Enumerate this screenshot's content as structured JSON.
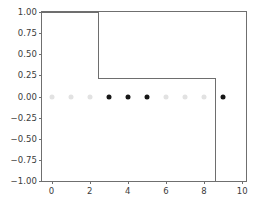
{
  "chart_data": {
    "type": "line",
    "title": "",
    "xlabel": "",
    "ylabel": "",
    "xlim": [
      -0.5,
      10.2
    ],
    "ylim": [
      -1.0,
      1.0
    ],
    "grid": false,
    "legend": null,
    "x_ticks": [
      0,
      2,
      4,
      6,
      8,
      10
    ],
    "x_tick_labels": [
      "0",
      "2",
      "4",
      "6",
      "8",
      "10"
    ],
    "y_ticks": [
      -1.0,
      -0.75,
      -0.5,
      -0.25,
      0.0,
      0.25,
      0.5,
      0.75,
      1.0
    ],
    "y_tick_labels": [
      "−1.00",
      "−0.75",
      "−0.50",
      "−0.25",
      "0.00",
      "0.25",
      "0.50",
      "0.75",
      "1.00"
    ],
    "series": [
      {
        "name": "step-curve",
        "type": "step",
        "color": "#6e6e6e",
        "linewidth": 1.3,
        "vertices": [
          {
            "x": -0.5,
            "y": 1.0
          },
          {
            "x": 2.45,
            "y": 1.0
          },
          {
            "x": 2.45,
            "y": 0.22
          },
          {
            "x": 8.6,
            "y": 0.22
          },
          {
            "x": 8.6,
            "y": -1.0
          }
        ]
      },
      {
        "name": "samples",
        "type": "scatter",
        "marker": "o",
        "size": 5,
        "y_value": 0.0,
        "points": [
          {
            "x": 0,
            "y": 0.0,
            "color": "#e2e2e2",
            "state": "inactive"
          },
          {
            "x": 1,
            "y": 0.0,
            "color": "#e2e2e2",
            "state": "inactive"
          },
          {
            "x": 2,
            "y": 0.0,
            "color": "#e2e2e2",
            "state": "inactive"
          },
          {
            "x": 3,
            "y": 0.0,
            "color": "#161616",
            "state": "active"
          },
          {
            "x": 4,
            "y": 0.0,
            "color": "#161616",
            "state": "active"
          },
          {
            "x": 5,
            "y": 0.0,
            "color": "#161616",
            "state": "active"
          },
          {
            "x": 6,
            "y": 0.0,
            "color": "#e2e2e2",
            "state": "inactive"
          },
          {
            "x": 7,
            "y": 0.0,
            "color": "#e2e2e2",
            "state": "inactive"
          },
          {
            "x": 8,
            "y": 0.0,
            "color": "#e2e2e2",
            "state": "inactive"
          },
          {
            "x": 9,
            "y": 0.0,
            "color": "#161616",
            "state": "active"
          }
        ]
      }
    ],
    "colors": {
      "axis": "#6f6f6f",
      "line": "#6e6e6e",
      "marker_active": "#161616",
      "marker_inactive": "#e2e2e2",
      "background": "#ffffff",
      "tick_text": "#3b3b3b"
    }
  }
}
